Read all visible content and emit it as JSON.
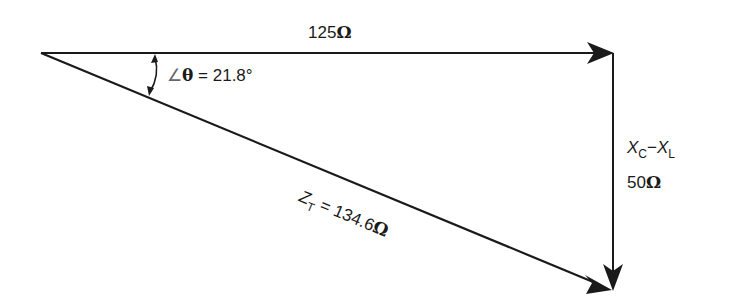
{
  "diagram": {
    "type": "impedance-triangle",
    "resistance": {
      "value": "125",
      "unit": "Ω"
    },
    "reactance": {
      "symbol": "X",
      "sub_c": "C",
      "minus": "−",
      "sub_l": "L",
      "value": "50",
      "unit": "Ω"
    },
    "angle": {
      "symbol": "∠",
      "theta": "θ",
      "text": " = 21.8°"
    },
    "impedance": {
      "symbol": "Z",
      "sub": "T",
      "text": " = 134.6",
      "unit": "Ω"
    },
    "colors": {
      "line": "#1a1a1a",
      "background": "#ffffff"
    }
  }
}
